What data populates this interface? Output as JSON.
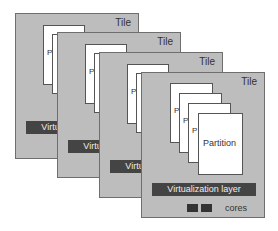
{
  "diagram": {
    "tiles": [
      {
        "label": "Tile",
        "partition_label": "P",
        "layer_label": "Virtualization layer"
      },
      {
        "label": "Tile",
        "partition_label": "P",
        "layer_label": "Virtualization layer"
      },
      {
        "label": "Tile",
        "partition_label": "P",
        "layer_label": "Virtualization layer"
      },
      {
        "label": "Tile",
        "partition_label": "P",
        "layer_label": "Virtualization layer"
      }
    ],
    "front": {
      "partition_label": "Partition",
      "cores_label": "cores"
    }
  }
}
